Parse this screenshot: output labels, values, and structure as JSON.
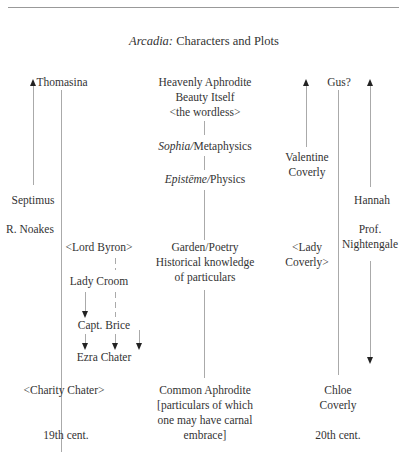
{
  "title": {
    "italic": "Arcadia:",
    "rest": " Characters and Plots"
  },
  "col19": {
    "top": "Thomasina",
    "septimus": "Septimus",
    "noakes": "R. Noakes",
    "byron": "<Lord Byron>",
    "croom": "Lady Croom",
    "brice": "Capt. Brice",
    "ezra": "Ezra Chater",
    "charity": "<Charity Chater>",
    "footer": "19th cent."
  },
  "center": {
    "heavenly": [
      "Heavenly Aphrodite",
      "Beauty Itself",
      "<the wordless>"
    ],
    "sophia": {
      "italic": "Sophia",
      "slash": "/",
      "rest": "Metaphysics"
    },
    "episteme": {
      "italic": "Epistēme",
      "slash": "/",
      "rest": "Physics"
    },
    "garden": [
      "Garden/Poetry",
      "Historical knowledge",
      "of particulars"
    ],
    "common": [
      "Common Aphrodite",
      "[particulars of which",
      "one may have carnal",
      "embrace]"
    ]
  },
  "col20": {
    "top": "Gus?",
    "valentine": [
      "Valentine",
      "Coverly"
    ],
    "hannah": "Hannah",
    "nightengale": [
      "Prof.",
      "Nightengale"
    ],
    "ladycoverly": [
      "<Lady",
      "Coverly>"
    ],
    "chloe": [
      "Chloe",
      "Coverly"
    ],
    "footer": "20th cent."
  }
}
